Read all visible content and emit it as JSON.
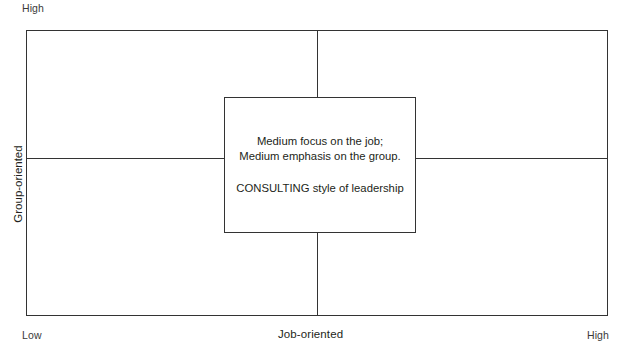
{
  "diagram": {
    "line_color": "#333333",
    "text_color": "#231f20"
  },
  "axes": {
    "y": {
      "name": "Group-oriented",
      "high_label": "High",
      "low_label": "Low"
    },
    "x": {
      "name": "Job-oriented",
      "low_label": "Low",
      "high_label": "High"
    }
  },
  "center_box": {
    "line1": "Medium focus on the job;",
    "line2": "Medium emphasis on the group.",
    "line3": "CONSULTING style of leadership"
  },
  "chart_data": {
    "type": "scatter",
    "xlabel": "Job-oriented",
    "ylabel": "Group-oriented",
    "xlim": [
      0,
      1
    ],
    "ylim": [
      0,
      1
    ],
    "xtick_labels": [
      "Low",
      "High"
    ],
    "ytick_labels": [
      "Low",
      "High"
    ],
    "grid": true,
    "gridlines": {
      "x": [
        0.5
      ],
      "y": [
        0.5
      ]
    },
    "annotations": [
      {
        "x": 0.5,
        "y": 0.5,
        "text": "Medium focus on the job; Medium emphasis on the group. CONSULTING style of leadership",
        "box": true
      }
    ]
  }
}
